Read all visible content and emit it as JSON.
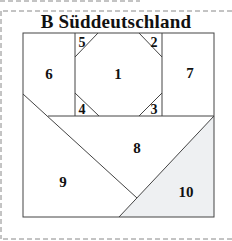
{
  "title": "B  Süddeutschland",
  "pieces": [
    {
      "id": "1",
      "label": "1"
    },
    {
      "id": "2",
      "label": "2"
    },
    {
      "id": "3",
      "label": "3"
    },
    {
      "id": "4",
      "label": "4"
    },
    {
      "id": "5",
      "label": "5"
    },
    {
      "id": "6",
      "label": "6"
    },
    {
      "id": "7",
      "label": "7"
    },
    {
      "id": "8",
      "label": "8"
    },
    {
      "id": "9",
      "label": "9"
    },
    {
      "id": "10",
      "label": "10"
    }
  ],
  "colors": {
    "line": "#444444",
    "shaded": "#eef0f2",
    "dash": "#888888"
  }
}
